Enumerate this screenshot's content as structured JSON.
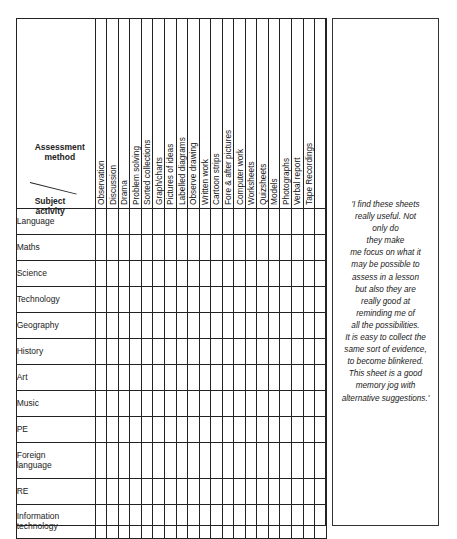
{
  "corner": {
    "top_label_line1": "Assessment",
    "top_label_line2": "method",
    "bottom_label_line1": "Subject",
    "bottom_label_line2": "activity"
  },
  "methods": [
    "Observation",
    "Discussion",
    "Drama",
    "Problem solving",
    "Sorted collections",
    "Graph/charts",
    "Pictures of ideas",
    "Labelled diagrams",
    "Observe drawing",
    "Written work",
    "Cartoon strips",
    "Fore & after pictures",
    "Computer work",
    "Worksheets",
    "Quizsheets",
    "Models",
    "Photographs",
    "Verbal report",
    "Tape Recordings",
    ""
  ],
  "subjects": [
    {
      "line1": "Language",
      "line2": ""
    },
    {
      "line1": "Maths",
      "line2": ""
    },
    {
      "line1": "Science",
      "line2": ""
    },
    {
      "line1": "Technology",
      "line2": ""
    },
    {
      "line1": "Geography",
      "line2": ""
    },
    {
      "line1": "History",
      "line2": ""
    },
    {
      "line1": "Art",
      "line2": ""
    },
    {
      "line1": "Music",
      "line2": ""
    },
    {
      "line1": "PE",
      "line2": ""
    },
    {
      "line1": "Foreign",
      "line2": "language"
    },
    {
      "line1": "RE",
      "line2": ""
    },
    {
      "line1": "Information",
      "line2": "technology"
    }
  ],
  "quote": {
    "lines": [
      "'I find these sheets",
      "really useful. Not",
      "only do",
      "they make",
      "me focus on what it",
      "may be possible to",
      "assess in a lesson",
      "but also they are",
      "really good at",
      "reminding me of",
      "all the possibilities.",
      "It is easy to collect the",
      "same sort of evidence,",
      "to become blinkered.",
      "This sheet is a good",
      "memory jog with",
      "alternative suggestions.'"
    ]
  }
}
